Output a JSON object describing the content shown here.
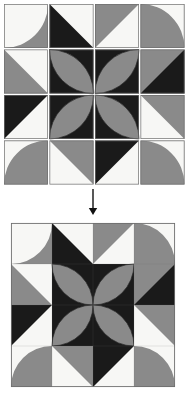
{
  "figure": {
    "arrow": {
      "name": "down-arrow",
      "direction": "down",
      "glyph": "↓"
    }
  },
  "colors": {
    "background": "#ffffff",
    "patch_white": "#f7f7f5",
    "patch_gray": "#8a8a8a",
    "patch_black": "#1a1a1a",
    "outline": "#6e6e6e",
    "arc_line": "#2a2a2a",
    "arrow": "#111111"
  },
  "layout": {
    "exploded_block": {
      "x": 4,
      "y": 4,
      "cell": 44,
      "gap": 1.5,
      "rows": 4,
      "cols": 4
    },
    "assembled_block": {
      "x": 11,
      "y": 223,
      "cell": 41,
      "rows": 4,
      "cols": 4
    },
    "arrow_line": {
      "x": 93,
      "y1": 189,
      "y2": 215
    }
  },
  "block": {
    "name": "pinwheel-petal-block",
    "rows": 4,
    "cols": 4,
    "patch_types": [
      {
        "id": "quarter-arc",
        "label": "quarter circle patch"
      },
      {
        "id": "half-triangle",
        "label": "half square triangle patch"
      },
      {
        "id": "lens-leaf",
        "label": "pointed leaf petal patch"
      }
    ],
    "patches": [
      {
        "r": 0,
        "c": 0,
        "type": "quarter-arc",
        "bg": "white",
        "fg": "gray",
        "corner": "br",
        "label": "patch-r1c1"
      },
      {
        "r": 0,
        "c": 1,
        "type": "half-triangle",
        "bg": "white",
        "fg": "black",
        "diag": "tl-br",
        "fill_side": "lower",
        "label": "patch-r1c2"
      },
      {
        "r": 0,
        "c": 2,
        "type": "half-triangle",
        "bg": "white",
        "fg": "gray",
        "diag": "tr-bl",
        "fill_side": "upper",
        "label": "patch-r1c3"
      },
      {
        "r": 0,
        "c": 3,
        "type": "quarter-arc",
        "bg": "gray",
        "fg": "white",
        "corner": "tr",
        "label": "patch-r1c4"
      },
      {
        "r": 1,
        "c": 0,
        "type": "half-triangle",
        "bg": "white",
        "fg": "gray",
        "diag": "tl-br",
        "fill_side": "lower",
        "label": "patch-r2c1"
      },
      {
        "r": 1,
        "c": 1,
        "type": "lens-leaf",
        "bg": "black",
        "fg": "gray",
        "orient": "tl-br",
        "label": "patch-r2c2"
      },
      {
        "r": 1,
        "c": 2,
        "type": "lens-leaf",
        "bg": "black",
        "fg": "gray",
        "orient": "tr-bl",
        "label": "patch-r2c3"
      },
      {
        "r": 1,
        "c": 3,
        "type": "half-triangle",
        "bg": "gray",
        "fg": "black",
        "diag": "tr-bl",
        "fill_side": "lower",
        "label": "patch-r2c4"
      },
      {
        "r": 2,
        "c": 0,
        "type": "half-triangle",
        "bg": "white",
        "fg": "black",
        "diag": "tr-bl",
        "fill_side": "upper",
        "label": "patch-r3c1"
      },
      {
        "r": 2,
        "c": 1,
        "type": "lens-leaf",
        "bg": "black",
        "fg": "gray",
        "orient": "tr-bl",
        "label": "patch-r3c2"
      },
      {
        "r": 2,
        "c": 2,
        "type": "lens-leaf",
        "bg": "black",
        "fg": "gray",
        "orient": "tl-br",
        "label": "patch-r3c3"
      },
      {
        "r": 2,
        "c": 3,
        "type": "half-triangle",
        "bg": "white",
        "fg": "gray",
        "diag": "tl-br",
        "fill_side": "upper",
        "label": "patch-r3c4"
      },
      {
        "r": 3,
        "c": 0,
        "type": "quarter-arc",
        "bg": "gray",
        "fg": "white",
        "corner": "tl",
        "label": "patch-r4c1"
      },
      {
        "r": 3,
        "c": 1,
        "type": "half-triangle",
        "bg": "white",
        "fg": "gray",
        "diag": "tl-br",
        "fill_side": "upper",
        "label": "patch-r4c2"
      },
      {
        "r": 3,
        "c": 2,
        "type": "half-triangle",
        "bg": "white",
        "fg": "black",
        "diag": "tr-bl",
        "fill_side": "upper",
        "label": "patch-r4c3"
      },
      {
        "r": 3,
        "c": 3,
        "type": "quarter-arc",
        "bg": "gray",
        "fg": "white",
        "corner": "tr",
        "label": "patch-r4c4"
      }
    ]
  }
}
